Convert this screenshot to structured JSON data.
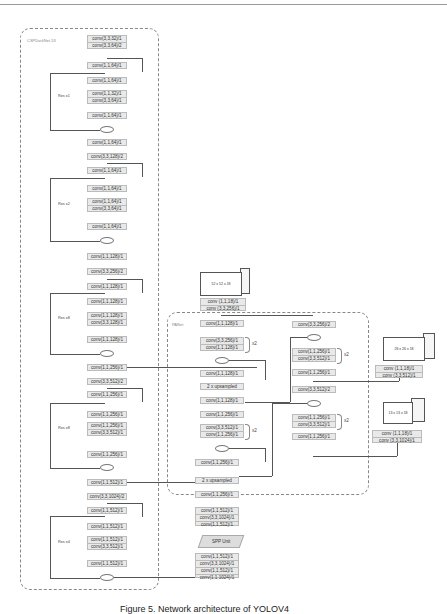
{
  "diagram": {
    "backbone": {
      "label": "CSPDarkNet-53",
      "blocks": [
        {
          "lines": [
            "conv(3,3,32)/1",
            "conv(3,3,64)/2"
          ]
        },
        {
          "lines": [
            "conv(1,1,64)/1"
          ]
        },
        {
          "lines": [
            "conv(1,1,64)/1"
          ]
        },
        {
          "lines": [
            "conv(1,1,32)/1",
            "conv(3,3,64)/1"
          ],
          "repeat": "Res x1"
        },
        {
          "lines": [
            "conv(1,1,64)/1"
          ]
        },
        {
          "lines": [
            "conv(1,1,64)/1"
          ]
        },
        {
          "lines": [
            "conv(3,3,128)/2"
          ]
        },
        {
          "lines": [
            "conv(1,1,64)/1"
          ]
        },
        {
          "lines": [
            "conv(1,1,64)/1"
          ]
        },
        {
          "lines": [
            "conv(1,1,64)/1",
            "conv(3,3,64)/1"
          ],
          "repeat": "Res x2"
        },
        {
          "lines": [
            "conv(1,1,64)/1"
          ]
        },
        {
          "lines": [
            "conv(1,1,128)/1"
          ]
        },
        {
          "lines": [
            "conv(3,3,256)/2"
          ]
        },
        {
          "lines": [
            "conv(1,1,128)/1"
          ]
        },
        {
          "lines": [
            "conv(1,1,128)/1"
          ]
        },
        {
          "lines": [
            "conv(1,1,128)/1",
            "conv(3,3,128)/1"
          ],
          "repeat": "Res x8"
        },
        {
          "lines": [
            "conv(1,1,128)/1"
          ]
        },
        {
          "lines": [
            "conv(1,1,256)/1"
          ]
        },
        {
          "lines": [
            "conv(3,3,512)/2"
          ]
        },
        {
          "lines": [
            "conv(1,1,256)/1"
          ]
        },
        {
          "lines": [
            "conv(1,1,256)/1"
          ]
        },
        {
          "lines": [
            "conv(1,1,256)/1",
            "conv(3,3,512)/1"
          ],
          "repeat": "Res x8"
        },
        {
          "lines": [
            "conv(1,1,256)/1"
          ]
        },
        {
          "lines": [
            "conv(1,1,512)/1"
          ]
        },
        {
          "lines": [
            "conv(3,3,1024)/2"
          ]
        },
        {
          "lines": [
            "conv(1,1,512)/1"
          ]
        },
        {
          "lines": [
            "conv(1,1,512)/1"
          ]
        },
        {
          "lines": [
            "conv(1,1,512)/1",
            "conv(3,3,512)/1"
          ],
          "repeat": "Res x4"
        },
        {
          "lines": [
            "conv(1,1,512)/1"
          ]
        }
      ]
    },
    "panet": {
      "label": "PANet",
      "left_column": [
        {
          "lines": [
            "conv(1,1,128)/1"
          ]
        },
        {
          "lines": [
            "conv(3,3,256)/1",
            "conv(1,1,128)/1"
          ],
          "repeat": "x2"
        },
        {
          "lines": [
            "conv(1,1,128)/1"
          ]
        },
        {
          "lines": [
            "2 x upsampled"
          ]
        },
        {
          "lines": [
            "conv(1,1,128)/1"
          ]
        },
        {
          "lines": [
            "conv(1,1,256)/1"
          ]
        },
        {
          "lines": [
            "conv(3,3,512)/1",
            "conv(1,1,256)/1"
          ],
          "repeat": "x2"
        },
        {
          "lines": [
            "conv(1,1,256)/1"
          ]
        },
        {
          "lines": [
            "2 x upsampled"
          ]
        },
        {
          "lines": [
            "conv(1,1,256)/1"
          ]
        },
        {
          "lines": [
            "conv(1,1,512)/1",
            "conv(3,3,1024)/1",
            "conv(1,1,512)/1"
          ]
        }
      ],
      "right_column": [
        {
          "lines": [
            "conv(3,3,256)/2"
          ]
        },
        {
          "lines": [
            "conv(1,1,256)/1",
            "conv(3,3,512)/1"
          ],
          "repeat": "x2"
        },
        {
          "lines": [
            "conv(1,1,256)/1"
          ]
        },
        {
          "lines": [
            "conv(3,3,512)/2"
          ]
        },
        {
          "lines": [
            "conv(1,1,256)/1",
            "conv(3,3,512)/1"
          ],
          "repeat": "x2"
        },
        {
          "lines": [
            "conv(1,1,256)/1"
          ]
        }
      ]
    },
    "heads": [
      {
        "output": "52 x 52 x 18",
        "lines": [
          "conv (1,1,18)/1",
          "conv (3,3,256)/1"
        ]
      },
      {
        "output": "26 x 26 x 18",
        "lines": [
          "conv (1,1,18)/1",
          "conv (3,3,512)/1"
        ]
      },
      {
        "output": "13 x 13 x 18",
        "lines": [
          "conv (1,1,18)/1",
          "conv (3,3,1024)/1"
        ]
      }
    ],
    "spp": {
      "label": "SPP Unit",
      "pre": [
        "conv(1,1,512)/1",
        "conv(3,3,1024)/1",
        "conv(1,1,512)/1",
        "conv(1,1,1024)/1"
      ]
    },
    "caption": "Figure 5. Network architecture of YOLOV4"
  }
}
